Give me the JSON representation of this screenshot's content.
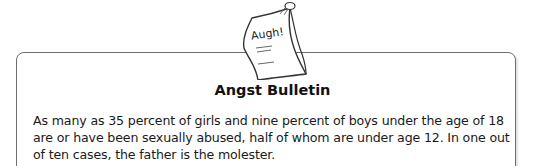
{
  "bulletin": {
    "icon_label": "Augh!",
    "title": "Angst Bulletin",
    "body": "As many as 35 percent of girls and nine percent of boys under the age of 18 are or have been sexually abused, half of whom are under age 12. In one out of ten cases, the father is the molester."
  }
}
